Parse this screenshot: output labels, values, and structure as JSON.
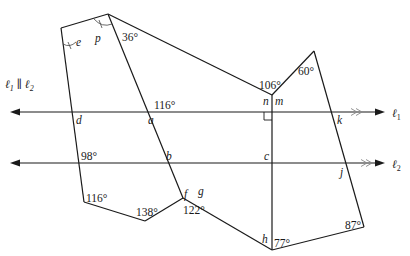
{
  "diagram": {
    "title_statement": "ℓ₁ ∥ ℓ₂",
    "lines": {
      "l1": {
        "label": "ℓ",
        "subscript": "1"
      },
      "l2": {
        "label": "ℓ",
        "subscript": "2"
      }
    },
    "angles": {
      "a36": "36°",
      "a116_top": "116°",
      "a106": "106°",
      "a60": "60°",
      "a98": "98°",
      "a116_bottom": "116°",
      "a138": "138°",
      "a122": "122°",
      "a77": "77°",
      "a87": "87°"
    },
    "variables": {
      "e": "e",
      "p": "p",
      "d": "d",
      "a": "a",
      "n": "n",
      "m": "m",
      "k": "k",
      "b": "b",
      "c": "c",
      "f": "f",
      "g": "g",
      "j": "j",
      "h": "h"
    },
    "colors": {
      "stroke": "#1a1a1a",
      "parallel_mark": "#888888",
      "background": "#ffffff"
    }
  }
}
